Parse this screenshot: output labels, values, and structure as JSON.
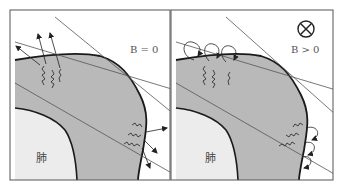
{
  "figure": {
    "panels": [
      {
        "id": "left",
        "field_label": "B = 0",
        "organ_label": "肺",
        "electron_behavior": "straight-escape"
      },
      {
        "id": "right",
        "field_label": "B > 0",
        "organ_label": "肺",
        "field_symbol": "into-page-circle-x",
        "electron_behavior": "curled-return"
      }
    ],
    "colors": {
      "frame": "#555555",
      "body_fill": "#b9b9b9",
      "lung_fill": "#ececec",
      "outline": "#1a1a1a",
      "beam_line": "#555555",
      "background": "#ffffff"
    }
  }
}
